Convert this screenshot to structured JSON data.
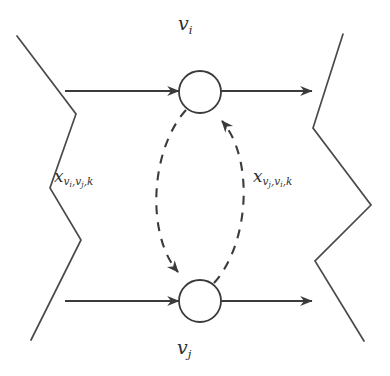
{
  "figure": {
    "type": "graph-diagram",
    "background_color": "#ffffff",
    "stroke_color": "#3b3b3b",
    "nodes": [
      {
        "id": "vi",
        "label": "v",
        "label_sub": "i",
        "label_position": "above",
        "cx": 200,
        "cy": 92,
        "r": 21
      },
      {
        "id": "vj",
        "label": "v",
        "label_sub": "j",
        "label_position": "below",
        "cx": 200,
        "cy": 301,
        "r": 21
      }
    ],
    "edge_labels": [
      {
        "id": "x-vi-vj-k",
        "var": "x",
        "sub_main": "v",
        "sub_of_sub_1": "i",
        "sub_sep_1": ",",
        "sub_main_2": "v",
        "sub_of_sub_2": "j",
        "sub_sep_2": ",",
        "sub_tail": "k",
        "position": "left",
        "describes": "dashed-arc-vi-to-vj"
      },
      {
        "id": "x-vj-vi-k",
        "var": "x",
        "sub_main": "v",
        "sub_of_sub_1": "j",
        "sub_sep_1": ",",
        "sub_main_2": "v",
        "sub_of_sub_2": "i",
        "sub_sep_2": ",",
        "sub_tail": "k",
        "position": "right",
        "describes": "dashed-arc-vj-to-vi"
      }
    ],
    "solid_arrows": [
      {
        "id": "arrow-in-vi",
        "x1": 65,
        "y1": 91,
        "x2": 179,
        "y2": 91,
        "style": "solid"
      },
      {
        "id": "arrow-out-vi",
        "x1": 221,
        "y1": 91,
        "x2": 312,
        "y2": 91,
        "style": "solid"
      },
      {
        "id": "arrow-in-vj",
        "x1": 65,
        "y1": 301,
        "x2": 179,
        "y2": 301,
        "style": "solid"
      },
      {
        "id": "arrow-out-vj",
        "x1": 221,
        "y1": 301,
        "x2": 312,
        "y2": 301,
        "style": "solid"
      }
    ],
    "dashed_arcs": [
      {
        "id": "dashed-arc-vi-to-vj",
        "from": "vi",
        "to": "vj",
        "side": "left",
        "style": "dashed"
      },
      {
        "id": "dashed-arc-vj-to-vi",
        "from": "vj",
        "to": "vi",
        "side": "right",
        "style": "dashed"
      }
    ],
    "boundary_zigzags": [
      {
        "id": "zigzag-left",
        "points": "17,36 76,114 50,188 81,240 31,340"
      },
      {
        "id": "zigzag-right",
        "points": "343,34 313,128 371,205 315,261 364,341"
      }
    ]
  }
}
